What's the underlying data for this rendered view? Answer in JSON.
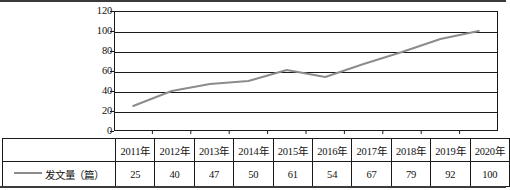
{
  "chart_data": {
    "type": "line",
    "title": "",
    "xlabel": "",
    "ylabel": "",
    "categories": [
      "2011年",
      "2012年",
      "2013年",
      "2014年",
      "2015年",
      "2016年",
      "2017年",
      "2018年",
      "2019年",
      "2020年"
    ],
    "series": [
      {
        "name": "发文量（篇）",
        "values": [
          25,
          40,
          47,
          50,
          61,
          54,
          67,
          79,
          92,
          100
        ],
        "color": "#8c8c8c"
      }
    ],
    "ylim": [
      0,
      120
    ],
    "yticks": [
      0,
      20,
      40,
      60,
      80,
      100,
      120
    ],
    "ytick_labels": [
      "0",
      "20",
      "40",
      "60",
      "80",
      "100",
      "120"
    ],
    "grid": true,
    "legend_position": "table-row-header"
  },
  "table": {
    "corner_label": "",
    "legend_label": "发文量（篇）",
    "legend_marker": "line-marker-icon",
    "header": [
      "2011年",
      "2012年",
      "2013年",
      "2014年",
      "2015年",
      "2016年",
      "2017年",
      "2018年",
      "2019年",
      "2020年"
    ],
    "values": [
      "25",
      "40",
      "47",
      "50",
      "61",
      "54",
      "67",
      "79",
      "92",
      "100"
    ]
  },
  "colors": {
    "series_line": "#8c8c8c",
    "axis": "#1a1a1a",
    "rule": "#3a3a3a",
    "background": "#ffffff"
  }
}
